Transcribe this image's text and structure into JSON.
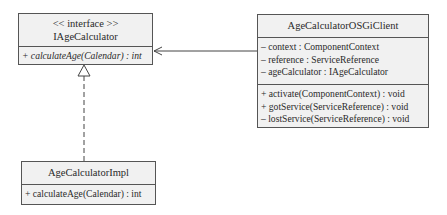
{
  "diagram": {
    "type": "uml-class-diagram",
    "classes": {
      "iface": {
        "stereotype": "<< interface >>",
        "name": "IAgeCalculator",
        "operations": [
          "+ calculateAge(Calendar) : int"
        ]
      },
      "impl": {
        "name": "AgeCalculatorImpl",
        "operations": [
          "+ calculateAge(Calendar) : int"
        ]
      },
      "client": {
        "name": "AgeCalculatorOSGiClient",
        "attributes": [
          "– context : ComponentContext",
          "– reference : ServiceReference",
          "– ageCalculator : IAgeCalculator"
        ],
        "operations": [
          "+ activate(ComponentContext) : void",
          "+ gotService(ServiceReference) : void",
          "– lostService(ServiceReference) : void"
        ]
      }
    },
    "relationships": [
      {
        "from": "AgeCalculatorImpl",
        "to": "IAgeCalculator",
        "kind": "realization"
      },
      {
        "from": "AgeCalculatorOSGiClient",
        "to": "IAgeCalculator",
        "kind": "association"
      }
    ],
    "colors": {
      "box_fill": "#f1f1f1",
      "border": "#555555",
      "line": "#444444"
    }
  }
}
